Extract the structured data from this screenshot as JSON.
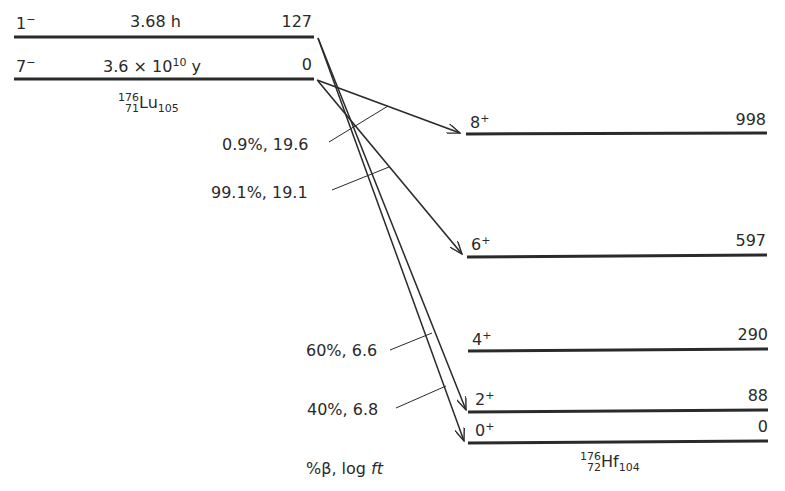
{
  "diagram": {
    "type": "nuclear-decay-scheme",
    "parent": {
      "nucleus": {
        "mass": "176",
        "z": "71",
        "symbol": "Lu",
        "n": "105"
      },
      "levels": [
        {
          "spin": "1",
          "parity": "−",
          "halflife": "3.68 h",
          "halflife_base": "",
          "halflife_exp": "",
          "energy": "127"
        },
        {
          "spin": "7",
          "parity": "−",
          "halflife_base": "3.6 × 10",
          "halflife_exp": "10",
          "halflife_unit": "y",
          "energy": "0"
        }
      ]
    },
    "daughter": {
      "nucleus": {
        "mass": "176",
        "z": "72",
        "symbol": "Hf",
        "n": "104"
      },
      "levels": [
        {
          "spin": "8",
          "parity": "+",
          "energy": "998"
        },
        {
          "spin": "6",
          "parity": "+",
          "energy": "597"
        },
        {
          "spin": "4",
          "parity": "+",
          "energy": "290"
        },
        {
          "spin": "2",
          "parity": "+",
          "energy": "88"
        },
        {
          "spin": "0",
          "parity": "+",
          "energy": "0"
        }
      ]
    },
    "branches": [
      {
        "from": "7- (0)",
        "to": "8+ (998)",
        "label": "0.9%, 19.6"
      },
      {
        "from": "7- (0)",
        "to": "6+ (597)",
        "label": "99.1%, 19.1"
      },
      {
        "from": "1- (127)",
        "to": "2+ (88)",
        "label": "60%, 6.6"
      },
      {
        "from": "1- (127)",
        "to": "0+ (0)",
        "label": "40%, 6.8"
      }
    ],
    "legend": {
      "prefix": "%β, log ",
      "italic": "ft"
    }
  }
}
